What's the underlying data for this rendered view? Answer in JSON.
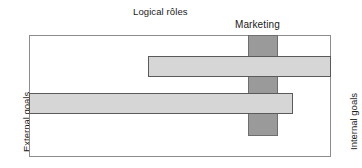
{
  "diagram": {
    "title": "Logical rôles",
    "axes": {
      "left_label": "External goals",
      "right_label": "Internal goals"
    },
    "bars": {
      "vertical": {
        "label": "Marketing",
        "color": "#9a9a9a",
        "border_color": "#6e6e6e"
      },
      "upper_horizontal": {
        "color": "#d6d6d6",
        "border_color": "#5a5a5a"
      },
      "lower_horizontal": {
        "color": "#d6d6d6",
        "border_color": "#5a5a5a"
      }
    },
    "frame": {
      "border_color": "#8c8c8c",
      "background": "#ffffff"
    }
  },
  "chart_data": {
    "type": "bar",
    "title": "Logical rôles",
    "xlabel": "",
    "ylabel": "",
    "grid": false,
    "legend": "none",
    "xlim": [
      0,
      302
    ],
    "ylim": [
      0,
      122
    ],
    "axis_annotations": {
      "left": "External goals",
      "right": "Internal goals"
    },
    "series": [
      {
        "name": "Marketing",
        "orientation": "vertical",
        "color": "#9a9a9a",
        "x_start": 219,
        "x_end": 249,
        "y_start": 0,
        "y_end": 101,
        "span_width": 30,
        "span_length": 101
      },
      {
        "name": "upper-horizontal-band",
        "orientation": "horizontal",
        "color": "#d6d6d6",
        "x_start": 119,
        "x_end": 302,
        "y_start": 21,
        "y_end": 42,
        "span_width": 21,
        "span_length": 183
      },
      {
        "name": "lower-horizontal-band",
        "orientation": "horizontal",
        "color": "#d6d6d6",
        "x_start": 0,
        "x_end": 264,
        "y_start": 58,
        "y_end": 79,
        "span_width": 21,
        "span_length": 264
      }
    ]
  }
}
